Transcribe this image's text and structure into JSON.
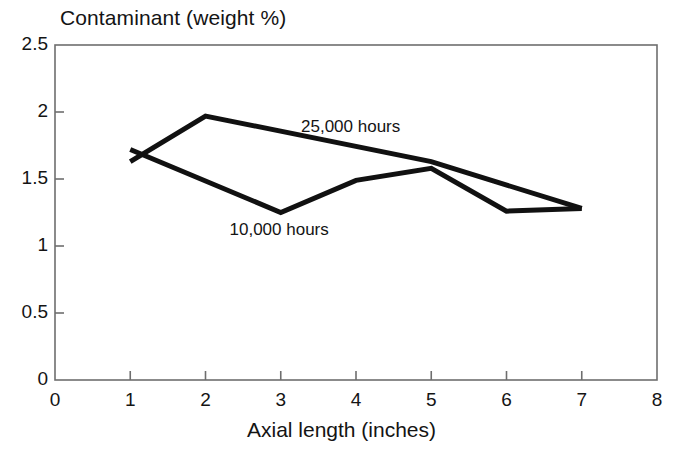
{
  "chart_data": {
    "type": "line",
    "title": "Contaminant (weight %)",
    "xlabel": "Axial length (inches)",
    "ylabel": "Contaminant (weight %)",
    "xlim": [
      0,
      8
    ],
    "ylim": [
      0,
      2.5
    ],
    "grid": false,
    "legend_position": "inline-annotations",
    "x_ticks": [
      "0",
      "1",
      "2",
      "3",
      "4",
      "5",
      "6",
      "7",
      "8"
    ],
    "x_tick_values": [
      0,
      1,
      2,
      3,
      4,
      5,
      6,
      7,
      8
    ],
    "y_ticks": [
      "0",
      "0.5",
      "1",
      "1.5",
      "2",
      "2.5"
    ],
    "y_tick_values": [
      0,
      0.5,
      1,
      1.5,
      2,
      2.5
    ],
    "series": [
      {
        "name": "25,000 hours",
        "x": [
          1,
          2,
          5,
          7
        ],
        "values": [
          1.63,
          1.97,
          1.63,
          1.28
        ],
        "color": "#111111"
      },
      {
        "name": "10,000 hours",
        "x": [
          1,
          3,
          4,
          5,
          6,
          7
        ],
        "values": [
          1.72,
          1.25,
          1.49,
          1.58,
          1.26,
          1.28
        ],
        "color": "#111111"
      }
    ],
    "annotations": [
      {
        "text": "25,000 hours",
        "x": 4.0,
        "y": 1.88
      },
      {
        "text": "10,000 hours",
        "x": 3.05,
        "y": 1.11
      }
    ]
  },
  "style": {
    "axis_color": "#6e6e6e",
    "line_color": "#111111",
    "text_color": "#141414",
    "background": "#ffffff"
  }
}
